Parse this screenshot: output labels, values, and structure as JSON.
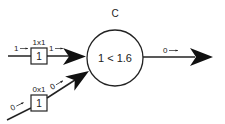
{
  "diagram": {
    "type": "perceptron",
    "colors": {
      "stroke": "#222222",
      "background": "#ffffff"
    },
    "node": {
      "label": "C",
      "expression": "1 < 1.6"
    },
    "inputs": [
      {
        "value_label": "1",
        "weight_label": "1x1",
        "weight_box": "1",
        "weighted_label": "1"
      },
      {
        "value_label": "0",
        "weight_label": "0x1",
        "weight_box": "1",
        "weighted_label": "0"
      }
    ],
    "output": {
      "value_label": "0"
    }
  }
}
